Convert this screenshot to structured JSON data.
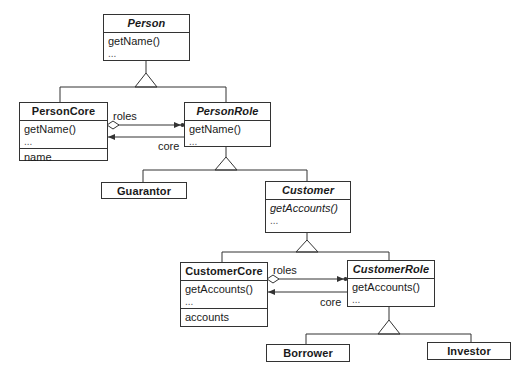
{
  "classes": {
    "person": {
      "name": "Person",
      "abstract": true,
      "operations": [
        "getName()",
        "..."
      ]
    },
    "person_core": {
      "name": "PersonCore",
      "operations": [
        "getName()",
        "..."
      ],
      "attributes": [
        "name"
      ]
    },
    "person_role": {
      "name": "PersonRole",
      "abstract": true,
      "operations": [
        "getName()",
        "..."
      ]
    },
    "guarantor": {
      "name": "Guarantor"
    },
    "customer": {
      "name": "Customer",
      "abstract": true,
      "operations": [
        "getAccounts()",
        "..."
      ]
    },
    "customer_core": {
      "name": "CustomerCore",
      "operations": [
        "getAccounts()",
        "..."
      ],
      "attributes": [
        "accounts"
      ]
    },
    "customer_role": {
      "name": "CustomerRole",
      "abstract": true,
      "operations": [
        "getAccounts()",
        "..."
      ]
    },
    "borrower": {
      "name": "Borrower"
    },
    "investor": {
      "name": "Investor"
    }
  },
  "associations": {
    "person_roles": {
      "label": "roles",
      "from": "PersonCore",
      "to": "PersonRole",
      "type": "aggregation"
    },
    "person_core": {
      "label": "core",
      "from": "PersonRole",
      "to": "PersonCore",
      "type": "navigable"
    },
    "customer_roles": {
      "label": "roles",
      "from": "CustomerCore",
      "to": "CustomerRole",
      "type": "aggregation"
    },
    "customer_core": {
      "label": "core",
      "from": "CustomerRole",
      "to": "CustomerCore",
      "type": "navigable"
    }
  },
  "generalizations": [
    {
      "parent": "Person",
      "children": [
        "PersonCore",
        "PersonRole"
      ]
    },
    {
      "parent": "PersonRole",
      "children": [
        "Guarantor",
        "Customer"
      ]
    },
    {
      "parent": "Customer",
      "children": [
        "CustomerCore",
        "CustomerRole"
      ]
    },
    {
      "parent": "CustomerRole",
      "children": [
        "Borrower",
        "Investor"
      ]
    }
  ]
}
